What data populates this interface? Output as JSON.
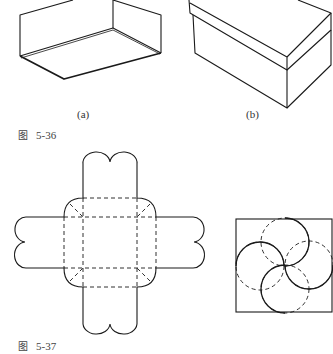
{
  "figure_5_36": {
    "caption_prefix": "图",
    "caption_number": "5-36",
    "subfigures": [
      {
        "label": "(a)",
        "description": "open box tray (lid/bottom)"
      },
      {
        "label": "(b)",
        "description": "closed box with lid"
      }
    ]
  },
  "figure_5_37": {
    "caption_prefix": "图",
    "caption_number": "5-37",
    "panels": [
      {
        "description": "unfolded box net with four scalloped flaps and dashed fold lines"
      },
      {
        "description": "square with four interlocking circles (pinwheel closure)"
      }
    ]
  },
  "colors": {
    "line": "#1a1a1a",
    "background": "#ffffff"
  }
}
